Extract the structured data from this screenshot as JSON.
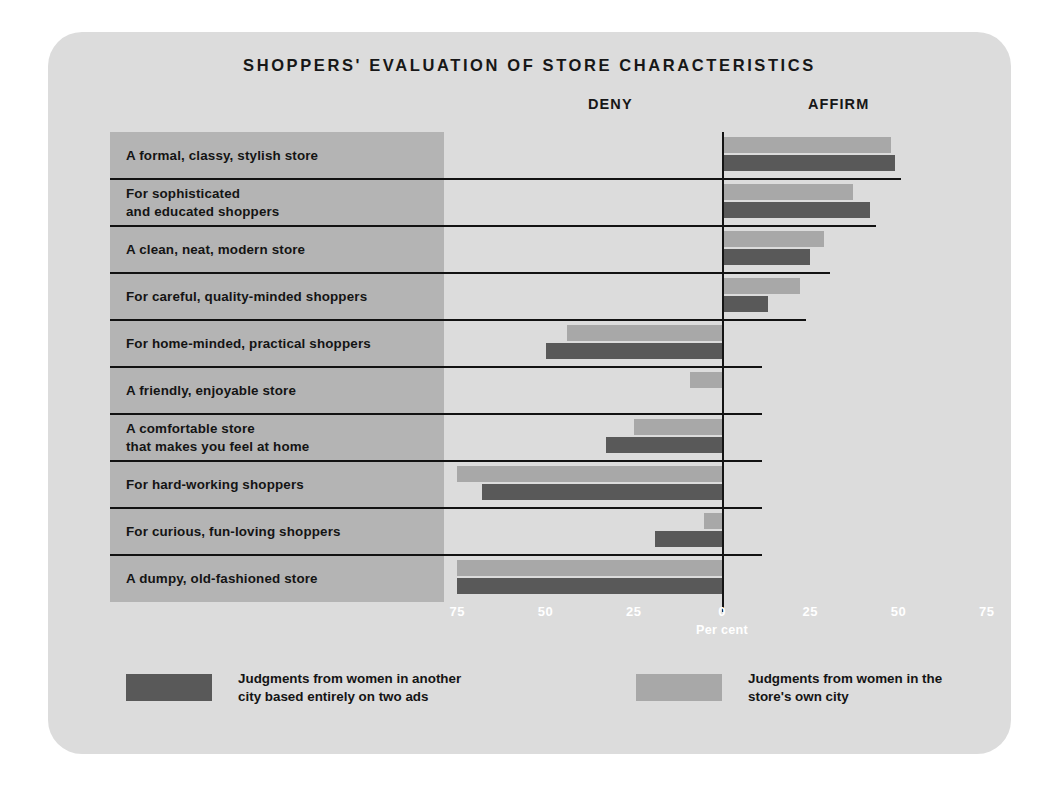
{
  "chart_data": {
    "type": "bar",
    "orientation": "horizontal",
    "layout": "diverging",
    "title": "SHOPPERS' EVALUATION OF STORE CHARACTERISTICS",
    "xlabel": "Per cent",
    "ylabel": "",
    "xlim": [
      -87,
      87
    ],
    "grid": false,
    "legend_position": "bottom",
    "left_axis_heading": "DENY",
    "right_axis_heading": "AFFIRM",
    "tick_values": [
      -75,
      -50,
      -25,
      0,
      25,
      50,
      75
    ],
    "tick_labels": [
      "75",
      "50",
      "25",
      "0",
      "25",
      "50",
      "75"
    ],
    "categories": [
      "A formal, classy, stylish store",
      "For sophisticated\nand educated shoppers",
      "A clean, neat, modern store",
      "For careful, quality-minded shoppers",
      "For home-minded, practical shoppers",
      "A friendly, enjoyable store",
      "A comfortable store\nthat makes you feel at home",
      "For hard-working shoppers",
      "For curious, fun-loving shoppers",
      "A dumpy, old-fashioned store"
    ],
    "series": [
      {
        "name": "Judgments from women in the\nstore's own city",
        "color": "#a8a8a8",
        "values": [
          48,
          37,
          29,
          22,
          -44,
          -9,
          -25,
          -75,
          -5,
          -75
        ]
      },
      {
        "name": "Judgments from women in another\ncity based entirely on two ads",
        "color": "#595959",
        "values": [
          49,
          42,
          25,
          13,
          -50,
          0,
          -33,
          -68,
          -19,
          -75
        ]
      }
    ]
  },
  "legend": [
    {
      "label": "Judgments from women in another\ncity based entirely on two ads",
      "color": "#595959"
    },
    {
      "label": "Judgments from women in the\nstore's own city",
      "color": "#a8a8a8"
    }
  ],
  "colors": {
    "card_background": "#dcdcdc",
    "label_panel": "#b4b4b4",
    "bar_light": "#a8a8a8",
    "bar_dark": "#595959",
    "axis": "#141414",
    "tick_text": "#ffffff"
  }
}
